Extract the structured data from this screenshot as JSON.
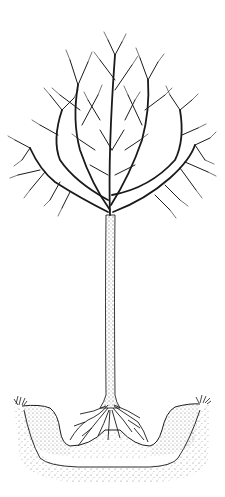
{
  "illustration": {
    "subject": "bare deciduous tree planted in a basin-shaped pit",
    "style": "black ink line drawing with stippled soil",
    "colors": {
      "ink": "#1a1a1a",
      "background": "#ffffff",
      "stipple": "#555555"
    },
    "parts": {
      "crown": "bare branching canopy",
      "trunk": "straight stippled trunk",
      "roots": "spreading root flare",
      "pit": "U-shaped planting hole with raised berms",
      "grass": "grass tufts at pit edges"
    }
  }
}
